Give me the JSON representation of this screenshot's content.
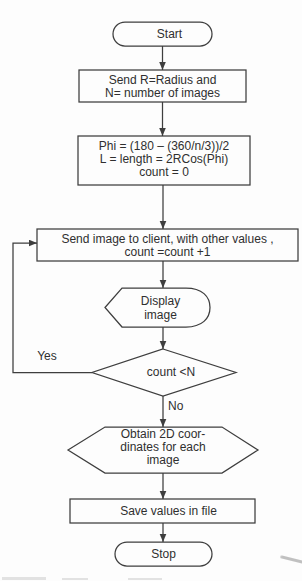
{
  "diagram": {
    "colors": {
      "line": "#3e3e3e",
      "text": "#2f2f2f",
      "background": "#fdfdfd"
    },
    "nodes": {
      "start": {
        "type": "terminator",
        "label": "Start"
      },
      "send_params": {
        "type": "process",
        "lines": [
          "Send R=Radius and",
          "N= number of images"
        ]
      },
      "compute": {
        "type": "process",
        "lines": [
          "Phi = (180 – (360/n/3))/2",
          "L = length = 2RCos(Phi)",
          "count = 0"
        ]
      },
      "send_image": {
        "type": "process",
        "lines": [
          "Send image to client, with other values ,",
          "count =count +1"
        ]
      },
      "display": {
        "type": "display",
        "lines": [
          "Display",
          "image"
        ]
      },
      "decision": {
        "type": "decision",
        "label": "count <N"
      },
      "obtain_coords": {
        "type": "preparation",
        "lines": [
          "Obtain 2D coor-",
          "dinates for each",
          "image"
        ]
      },
      "save": {
        "type": "process",
        "label": "Save values in file"
      },
      "stop": {
        "type": "terminator",
        "label": "Stop"
      }
    },
    "edges": {
      "yes_label": "Yes",
      "no_label": "No"
    }
  }
}
